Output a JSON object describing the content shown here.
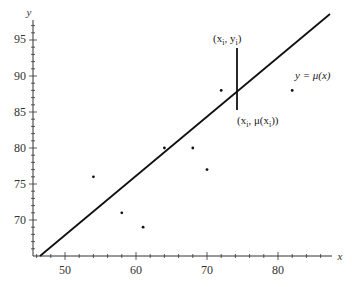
{
  "chart_data": {
    "type": "scatter",
    "title": "",
    "xlabel": "x",
    "ylabel": "y",
    "xlim": [
      45,
      88
    ],
    "ylim": [
      65,
      98
    ],
    "grid": false,
    "x_ticks": [
      50,
      60,
      70,
      80
    ],
    "y_ticks": [
      70,
      75,
      80,
      85,
      90,
      95
    ],
    "series": [
      {
        "name": "observations",
        "type": "scatter",
        "points": [
          {
            "x": 54,
            "y": 76
          },
          {
            "x": 58,
            "y": 71
          },
          {
            "x": 61,
            "y": 69
          },
          {
            "x": 64,
            "y": 80
          },
          {
            "x": 68,
            "y": 80
          },
          {
            "x": 70,
            "y": 77
          },
          {
            "x": 72,
            "y": 88
          },
          {
            "x": 82,
            "y": 88
          }
        ]
      },
      {
        "name": "y = μ(x)",
        "type": "line",
        "points": [
          {
            "x": 46.5,
            "y": 65
          },
          {
            "x": 87,
            "y": 98.6
          }
        ]
      }
    ],
    "annotations": [
      {
        "text_parts": [
          "(x",
          "i",
          ", y",
          "i",
          ")"
        ],
        "x": 74,
        "y": 94,
        "label": "(x_i, y_i)"
      },
      {
        "text_parts": [
          "(x",
          "i",
          ", μ(x",
          "i",
          "))"
        ],
        "x": 74,
        "y": 85.3,
        "label": "(x_i, μ(x_i))"
      },
      {
        "text": "y = μ(x)",
        "x": 84,
        "y": 91
      }
    ],
    "residual_segment": {
      "x": 74,
      "y_top": 94,
      "y_bottom": 85.3
    }
  },
  "labels": {
    "x_axis": "x",
    "y_axis": "y",
    "ticks_x": [
      "50",
      "60",
      "70",
      "80"
    ],
    "ticks_y": [
      "95",
      "90",
      "85",
      "80",
      "75",
      "70"
    ],
    "line_label": "y = μ(x)",
    "point_label_top_a": "(x",
    "point_label_top_sub1": "i",
    "point_label_top_b": ", y",
    "point_label_top_sub2": "i",
    "point_label_top_c": ")",
    "point_label_bottom_a": "(x",
    "point_label_bottom_sub1": "i",
    "point_label_bottom_b": ", μ(x",
    "point_label_bottom_sub2": "i",
    "point_label_bottom_c": "))"
  },
  "colors": {
    "axis": "#333333",
    "line": "#111111",
    "points": "#111111"
  }
}
